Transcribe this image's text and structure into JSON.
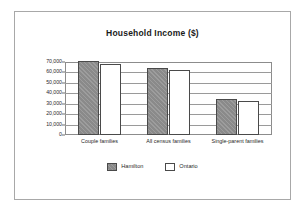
{
  "chart_data": {
    "type": "bar",
    "title": "Household Income ($)",
    "xlabel": "",
    "ylabel": "",
    "categories": [
      "Couple families",
      "All census families",
      "Single-parent families"
    ],
    "series": [
      {
        "name": "Hamilton",
        "values": [
          71000,
          64500,
          34500
        ],
        "color": "#8a8a8a"
      },
      {
        "name": "Ontario",
        "values": [
          68000,
          62500,
          33000
        ],
        "color": "#ffffff"
      }
    ],
    "ylim": [
      0,
      70000
    ],
    "yticks": [
      0,
      10000,
      20000,
      30000,
      40000,
      50000,
      60000,
      70000
    ],
    "ytick_labels": [
      "0",
      "10,000",
      "20,000",
      "30,000",
      "40,000",
      "50,000",
      "60,000",
      "70,000"
    ],
    "grid": true,
    "legend_position": "bottom-center"
  },
  "legend": {
    "items": [
      {
        "label": "Hamilton"
      },
      {
        "label": "Ontario"
      }
    ]
  }
}
